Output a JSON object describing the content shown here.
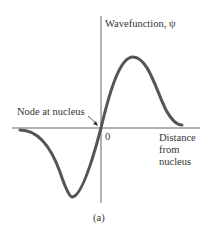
{
  "figure": {
    "y_axis_label": "Wavefunction, ψ",
    "x_axis_label_lines": [
      "Distance",
      "from",
      "nucleus"
    ],
    "origin_label": "0",
    "node_annotation": "Node at nucleus",
    "caption": "(a)"
  },
  "colors": {
    "curve": "#555555",
    "axes": "#666666",
    "text": "#333333"
  }
}
